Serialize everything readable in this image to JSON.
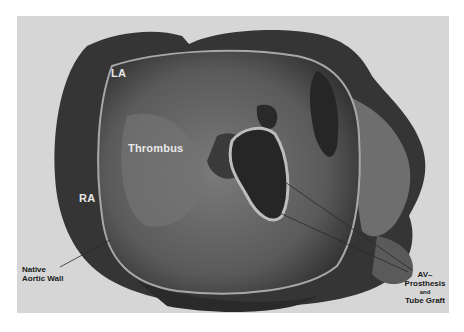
{
  "figure": {
    "type": "grayscale specimen photograph",
    "labels": {
      "la": "LA",
      "ra": "RA",
      "thrombus": "Thrombus",
      "native_wall_line1": "Native",
      "native_wall_line2": "Aortic Wall",
      "av_line1": "AV–",
      "av_line2": "Prosthesis",
      "av_line3": "and",
      "av_line4": "Tube Graft"
    },
    "colors": {
      "page_background": "#ffffff",
      "photo_background": "#d6d6d6",
      "tissue_dark": "#2e2e2e",
      "tissue_mid": "#6a6a6a",
      "tissue_light": "#9a9a9a"
    }
  }
}
